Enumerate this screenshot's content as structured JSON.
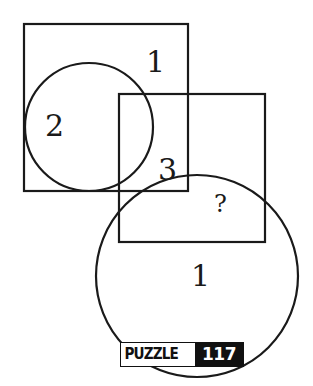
{
  "diagram": {
    "shapes": [
      {
        "type": "square",
        "name": "top-left-square",
        "x": 24,
        "y": 24,
        "w": 164,
        "h": 167
      },
      {
        "type": "circle",
        "name": "small-circle",
        "cx": 89,
        "cy": 127,
        "r": 64
      },
      {
        "type": "square",
        "name": "center-square",
        "x": 119,
        "y": 94,
        "w": 146,
        "h": 148
      },
      {
        "type": "circle",
        "name": "large-circle",
        "cx": 197,
        "cy": 276,
        "r": 101
      }
    ],
    "regions": [
      {
        "label": "1",
        "x": 146,
        "y": 72
      },
      {
        "label": "2",
        "x": 45,
        "y": 136
      },
      {
        "label": "3",
        "x": 158,
        "y": 180
      },
      {
        "label": "?",
        "x": 214,
        "y": 212
      },
      {
        "label": "1",
        "x": 191,
        "y": 286
      }
    ]
  },
  "badge": {
    "label": "PUZZLE",
    "number": "117"
  }
}
